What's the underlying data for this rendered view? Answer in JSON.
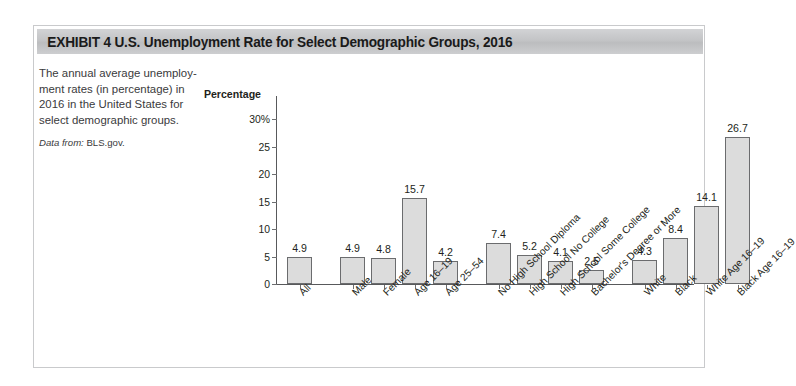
{
  "exhibit": {
    "title": "EXHIBIT 4   U.S. Unemployment Rate for Select Demographic Groups, 2016",
    "caption": "The annual average unemploy-\nment rates (in percentage) in\n2016 in the United States for\nselect demographic groups.",
    "source_lead": "Data from:",
    "source_value": "BLS.gov."
  },
  "chart_data": {
    "type": "bar",
    "title": "U.S. Unemployment Rate for Select Demographic Groups, 2016",
    "xlabel": "",
    "ylabel": "Percentage",
    "ylim": [
      0,
      30
    ],
    "ytick_labels": [
      "0",
      "5",
      "10",
      "15",
      "20",
      "25",
      "30%"
    ],
    "yticks": [
      0,
      5,
      10,
      15,
      20,
      25,
      30
    ],
    "grid": false,
    "legend": "none",
    "bar_color": "#dcdcdc",
    "bar_edge_color": "#6b6c6e",
    "groups": [
      {
        "name": "overall",
        "categories": [
          "All"
        ],
        "values": [
          4.9
        ]
      },
      {
        "name": "sex-and-age",
        "categories": [
          "Male",
          "Female",
          "Age 16–19",
          "Age 25–54"
        ],
        "values": [
          4.9,
          4.8,
          15.7,
          4.2
        ]
      },
      {
        "name": "education",
        "categories": [
          "No High School Diploma",
          "High School No College",
          "High School Some College",
          "Bachelor's Degree or More"
        ],
        "values": [
          7.4,
          5.2,
          4.1,
          2.5
        ]
      },
      {
        "name": "race",
        "categories": [
          "White",
          "Black",
          "White Age 16–19",
          "Black Age 16–19"
        ],
        "values": [
          4.3,
          8.4,
          14.1,
          26.7
        ]
      }
    ],
    "categories": [
      "All",
      "Male",
      "Female",
      "Age 16–19",
      "Age 25–54",
      "No High School Diploma",
      "High School No College",
      "High School Some College",
      "Bachelor's Degree or More",
      "White",
      "Black",
      "White Age 16–19",
      "Black Age 16–19"
    ],
    "values": [
      4.9,
      4.9,
      4.8,
      15.7,
      4.2,
      7.4,
      5.2,
      4.1,
      2.5,
      4.3,
      8.4,
      14.1,
      26.7
    ],
    "data_labels": [
      "4.9",
      "4.9",
      "4.8",
      "15.7",
      "4.2",
      "7.4",
      "5.2",
      "4.1",
      "2.5",
      "4.3",
      "8.4",
      "14.1",
      "26.7"
    ]
  }
}
